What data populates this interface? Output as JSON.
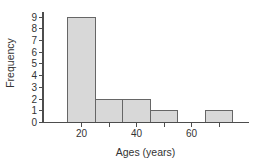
{
  "chart_data": {
    "type": "bar",
    "subtype": "histogram",
    "title": "",
    "xlabel": "Ages (years)",
    "ylabel": "Frequency",
    "bins": [
      {
        "start": 15,
        "end": 25,
        "count": 9
      },
      {
        "start": 25,
        "end": 35,
        "count": 2
      },
      {
        "start": 35,
        "end": 45,
        "count": 2
      },
      {
        "start": 45,
        "end": 55,
        "count": 1
      },
      {
        "start": 55,
        "end": 65,
        "count": 0
      },
      {
        "start": 65,
        "end": 75,
        "count": 1
      }
    ],
    "xlim": [
      6,
      80.5
    ],
    "ylim": [
      0,
      9
    ],
    "xticks": [
      20,
      30,
      40,
      50,
      60,
      70
    ],
    "xtick_labeled": [
      "20",
      "40",
      "60"
    ],
    "xtick_labeled_values": [
      20,
      40,
      60
    ],
    "yticks": [
      "0",
      "1",
      "2",
      "3",
      "4",
      "5",
      "6",
      "7",
      "8",
      "9"
    ],
    "grid": false,
    "legend": false,
    "colors": {
      "bar_fill": "#d8d8d8",
      "bar_stroke": "#666666",
      "axis": "#4d4d4d",
      "text": "#333333",
      "background": "#ffffff"
    }
  }
}
